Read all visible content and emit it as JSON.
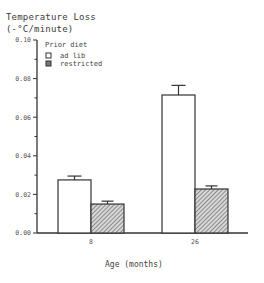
{
  "chart_data": {
    "type": "bar",
    "title": "Temperature Loss",
    "subtitle": "(-°C/minute)",
    "xlabel": "Age (months)",
    "ylabel": "Temperature Loss (-°C/minute)",
    "categories": [
      "8",
      "26"
    ],
    "series": [
      {
        "name": "ad lib",
        "fill": "#ffffff",
        "pattern": "none",
        "values": [
          0.0275,
          0.0715
        ],
        "error": [
          0.002,
          0.005
        ]
      },
      {
        "name": "restricted",
        "fill": "#888888",
        "pattern": "diagonal-hatch",
        "values": [
          0.015,
          0.0228
        ],
        "error": [
          0.0015,
          0.0016
        ]
      }
    ],
    "ylim": [
      0,
      0.1
    ],
    "yticks": [
      "0.00",
      "0.02",
      "0.04",
      "0.06",
      "0.08",
      "0.10"
    ],
    "legend": {
      "title": "Prior diet",
      "position": "top-left inside",
      "entries": [
        "ad lib",
        "restricted"
      ]
    },
    "grid": false
  }
}
